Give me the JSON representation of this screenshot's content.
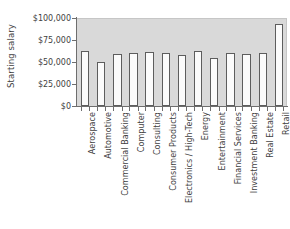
{
  "chart_data": {
    "type": "bar",
    "title": "",
    "xlabel": "",
    "ylabel": "Starting salary",
    "ylim": [
      0,
      100000
    ],
    "grid": false,
    "legend": null,
    "plot_background": "#d9d9d9",
    "bar_fill": "#fbfbfb",
    "bar_edge": "#5d5d5d",
    "ytick_labels": [
      "$100,000",
      "$75,000",
      "$50,000",
      "$25,000",
      "$0"
    ],
    "ytick_values": [
      100000,
      75000,
      50000,
      25000,
      0
    ],
    "categories": [
      "Aerospace",
      "Automotive",
      "Commercial Banking",
      "Computer",
      "Consulting",
      "Consumer Products",
      "Electronics / High-Tech",
      "Energy",
      "Entertainment",
      "Financial Services",
      "Investment Banking",
      "Real Estate",
      "Retail"
    ],
    "values": [
      63000,
      50000,
      59000,
      60000,
      61000,
      60000,
      58000,
      63000,
      54000,
      60000,
      59000,
      60000,
      93000
    ]
  }
}
